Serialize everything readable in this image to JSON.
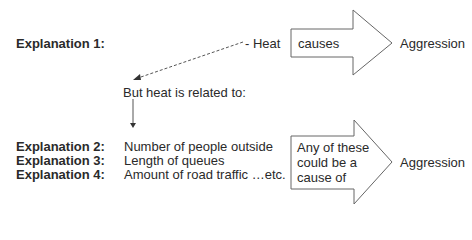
{
  "explanations": {
    "e1": {
      "label": "Explanation 1:"
    },
    "e2": {
      "label": "Explanation 2:",
      "item": "Number of people outside"
    },
    "e3": {
      "label": "Explanation 3:",
      "item": "Length of queues"
    },
    "e4": {
      "label": "Explanation 4:",
      "item": "Amount of road traffic …etc."
    }
  },
  "top_row": {
    "cause": "Heat",
    "arrow_text": "causes",
    "effect": "Aggression"
  },
  "middle": {
    "related_text": "But heat is related to:"
  },
  "bottom_row": {
    "arrow_text_line1": "Any of these",
    "arrow_text_line2": "could be a",
    "arrow_text_line3": "cause of",
    "effect": "Aggression"
  },
  "colors": {
    "stroke": "#555555",
    "text": "#2a2a2a",
    "background": "#ffffff"
  }
}
